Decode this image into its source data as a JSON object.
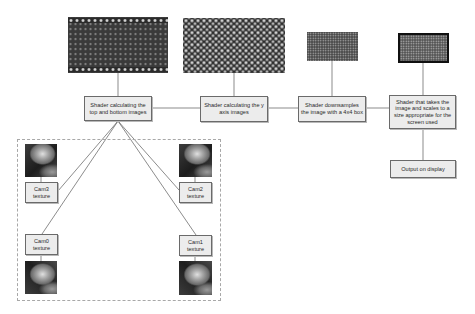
{
  "diagram": {
    "type": "rendering-pipeline-flowchart",
    "colors": {
      "box_fill": "#ececec",
      "box_border": "#6a6a6a",
      "line": "#5a5a5a",
      "frame_dashed": "#a8a8a8",
      "text": "#2a2a2a"
    },
    "pipeline": [
      {
        "id": "top-bottom",
        "label": "Shader calculating the top and bottom images",
        "image": "top-bottom-result-image"
      },
      {
        "id": "y-axis",
        "label": "Shader calculating the y axis images",
        "image": "y-axis-result-image"
      },
      {
        "id": "downsample",
        "label": "Shader downsamples the image with a 4x4 box",
        "image": "downsampled-result-image"
      },
      {
        "id": "scale",
        "label": "Shader that takes the image and scales to a size appropriate for the screen used",
        "image": "scaled-result-image"
      },
      {
        "id": "output",
        "label": "Output on display"
      }
    ],
    "camera_inputs": [
      {
        "id": "cam3",
        "label": "Cam3 texture"
      },
      {
        "id": "cam2",
        "label": "Cam2 texture"
      },
      {
        "id": "cam0",
        "label": "Cam0 texture"
      },
      {
        "id": "cam1",
        "label": "Cam1 texture"
      }
    ],
    "edges": [
      {
        "from": "cam3",
        "to": "top-bottom"
      },
      {
        "from": "cam2",
        "to": "top-bottom"
      },
      {
        "from": "cam0",
        "to": "top-bottom"
      },
      {
        "from": "cam1",
        "to": "top-bottom"
      },
      {
        "from": "top-bottom",
        "to": "y-axis"
      },
      {
        "from": "y-axis",
        "to": "downsample"
      },
      {
        "from": "downsample",
        "to": "scale"
      },
      {
        "from": "scale",
        "to": "output"
      }
    ]
  },
  "labels": {
    "shader1": "Shader calculating the top and bottom images",
    "shader2": "Shader calculating the y axis images",
    "shader3": "Shader downsamples the image with a 4x4 box",
    "shader4": "Shader that takes the image and scales to a size appropriate for the screen used",
    "output": "Output on display",
    "cam3": "Cam3 texture",
    "cam2": "Cam2 texture",
    "cam0": "Cam0 texture",
    "cam1": "Cam1 texture"
  }
}
